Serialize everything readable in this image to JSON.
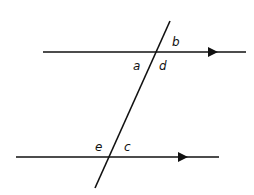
{
  "diagram": {
    "stroke_color": "#111111",
    "background": "#ffffff",
    "lines": {
      "upper": {
        "x1": 43,
        "y1": 52,
        "x2": 246,
        "y2": 52,
        "arrow_x": 213
      },
      "lower": {
        "x1": 16,
        "y1": 157,
        "x2": 219,
        "y2": 157,
        "arrow_x": 183
      },
      "transversal": {
        "x1": 170,
        "y1": 21,
        "x2": 95,
        "y2": 188
      }
    },
    "labels": {
      "a": "a",
      "b": "b",
      "c": "c",
      "d": "d",
      "e": "e"
    }
  }
}
